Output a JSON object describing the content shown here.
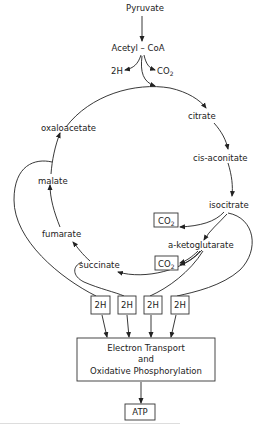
{
  "diagram": {
    "input": {
      "pyruvate": "Pyruvate",
      "acetyl_coa": "Acetyl – CoA"
    },
    "entry_products": {
      "h2": "2H",
      "co2": "CO",
      "co2_sub": "2"
    },
    "cycle": {
      "citrate": "citrate",
      "cis_aconitate": "cis-aconitate",
      "isocitrate": "isocitrate",
      "a_ketoglutarate": "a-ketoglutarate",
      "succinate": "succinate",
      "fumarate": "fumarate",
      "malate": "malate",
      "oxaloacetate": "oxaloacetate"
    },
    "co2_boxes": [
      {
        "label": "CO",
        "sub": "2"
      },
      {
        "label": "CO",
        "sub": "2"
      }
    ],
    "h2_boxes": [
      "2H",
      "2H",
      "2H",
      "2H"
    ],
    "electron_transport": {
      "line1": "Electron Transport",
      "line2": "and",
      "line3": "Oxidative Phosphorylation"
    },
    "output": "ATP",
    "colors": {
      "ink": "#222222",
      "background": "#ffffff"
    }
  }
}
